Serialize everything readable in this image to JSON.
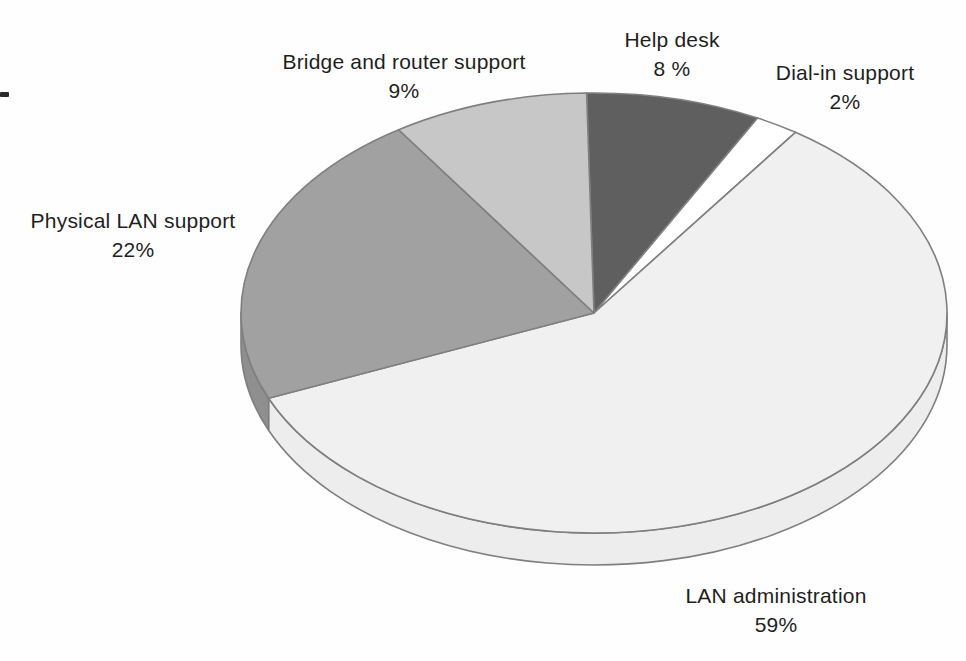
{
  "chart_data": {
    "type": "pie",
    "style": "3d",
    "direction": "clockwise",
    "start_angle_deg": -1.2,
    "legend": "none",
    "background": "#fefefe",
    "stroke": "#7f7f7f",
    "stroke_width": 1.6,
    "geometry": {
      "cx": 594,
      "cy": 313,
      "rx": 353,
      "ry": 220,
      "depth": 32
    },
    "slices": [
      {
        "id": "help-desk",
        "label": "Help desk",
        "value": 8,
        "display": "8 %",
        "color": "#5f5f5f"
      },
      {
        "id": "dial-in-support",
        "label": "Dial-in support",
        "value": 2,
        "display": "2%",
        "color": "#ffffff"
      },
      {
        "id": "lan-administration",
        "label": "LAN administration",
        "value": 59,
        "display": "59%",
        "color": "#f0f0f0",
        "side_color": "#ededed"
      },
      {
        "id": "physical-lan-support",
        "label": "Physical LAN support",
        "value": 22,
        "display": "22%",
        "color": "#a1a1a1",
        "side_color": "#8f8f8f"
      },
      {
        "id": "bridge-router-support",
        "label": "Bridge and router support",
        "value": 9,
        "display": "9%",
        "color": "#c7c7c7"
      }
    ]
  }
}
